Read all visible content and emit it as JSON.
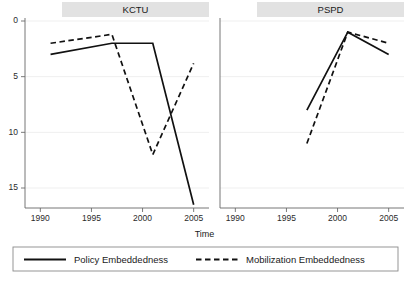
{
  "chart_data": {
    "type": "line",
    "title": "",
    "xlabel": "Time",
    "ylabel": "",
    "grid": true,
    "y_inverted": true,
    "ylim": [
      0,
      17.5
    ],
    "xlim": [
      1988.5,
      2006.5
    ],
    "y_ticks": [
      "0",
      "5",
      "10",
      "15"
    ],
    "y_tick_values": [
      0,
      5,
      10,
      15
    ],
    "x_ticks": [
      "1990",
      "1995",
      "2000",
      "2005"
    ],
    "x_tick_values": [
      1990,
      1995,
      2000,
      2005
    ],
    "legend_position": "bottom",
    "panels": [
      {
        "label": "KCTU",
        "series": [
          {
            "name": "Policy Embeddedness",
            "style": "solid",
            "x": [
              1991,
              1997,
              2001,
              2005
            ],
            "y": [
              3.0,
              2.0,
              2.0,
              16.5
            ]
          },
          {
            "name": "Mobilization Embeddedness",
            "style": "dashed",
            "x": [
              1991,
              1997,
              2001,
              2005
            ],
            "y": [
              2.0,
              1.2,
              12.0,
              3.8
            ]
          }
        ]
      },
      {
        "label": "PSPD",
        "series": [
          {
            "name": "Policy Embeddedness",
            "style": "solid",
            "x": [
              1997,
              2001,
              2005
            ],
            "y": [
              8.0,
              1.0,
              3.0
            ]
          },
          {
            "name": "Mobilization Embeddedness",
            "style": "dashed",
            "x": [
              1997,
              2001,
              2005
            ],
            "y": [
              11.0,
              1.0,
              2.0
            ]
          }
        ]
      }
    ],
    "legend": [
      {
        "label": "Policy Embeddedness",
        "style": "solid"
      },
      {
        "label": "Mobilization Embeddedness",
        "style": "dashed"
      }
    ],
    "colors": {
      "line": "#111111",
      "grid": "#efefef",
      "strip_background": "#e2e2e2",
      "axis": "#666666",
      "background": "#ffffff"
    }
  }
}
